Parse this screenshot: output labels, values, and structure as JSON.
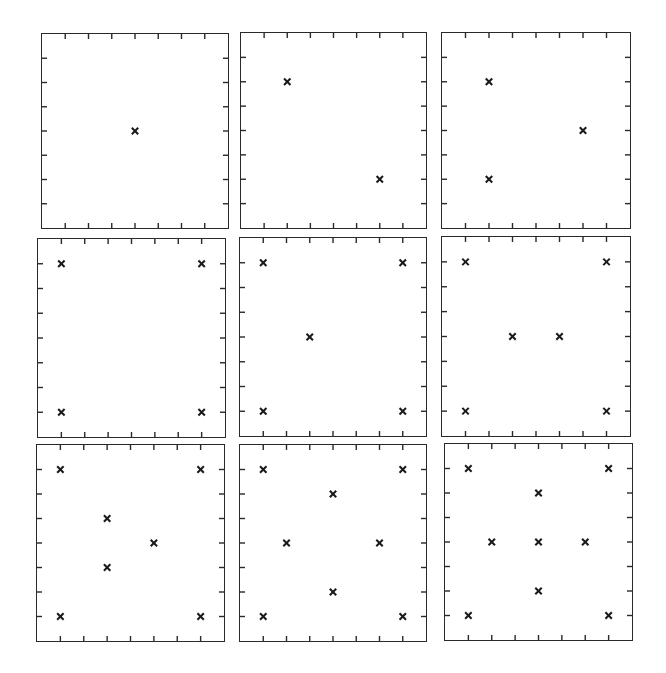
{
  "chart_data": {
    "type": "scatter",
    "title": "",
    "grid_divisions": 8,
    "marker": "x",
    "colors": {
      "frame": "#2a2a2a",
      "marker": "#1a1a1a",
      "background": "#ffffff"
    },
    "panels": [
      {
        "id": 1,
        "count": 1,
        "points": [
          [
            4,
            4
          ]
        ]
      },
      {
        "id": 2,
        "count": 2,
        "points": [
          [
            2,
            2
          ],
          [
            6,
            6
          ]
        ]
      },
      {
        "id": 3,
        "count": 3,
        "points": [
          [
            2,
            2
          ],
          [
            6,
            4
          ],
          [
            2,
            6
          ]
        ]
      },
      {
        "id": 4,
        "count": 4,
        "points": [
          [
            1,
            1
          ],
          [
            7,
            1
          ],
          [
            1,
            7
          ],
          [
            7,
            7
          ]
        ]
      },
      {
        "id": 5,
        "count": 5,
        "points": [
          [
            1,
            1
          ],
          [
            7,
            1
          ],
          [
            3,
            4
          ],
          [
            1,
            7
          ],
          [
            7,
            7
          ]
        ]
      },
      {
        "id": 6,
        "count": 6,
        "points": [
          [
            1,
            1
          ],
          [
            7,
            1
          ],
          [
            3,
            4
          ],
          [
            5,
            4
          ],
          [
            1,
            7
          ],
          [
            7,
            7
          ]
        ]
      },
      {
        "id": 7,
        "count": 7,
        "points": [
          [
            1,
            1
          ],
          [
            7,
            1
          ],
          [
            3,
            3
          ],
          [
            5,
            4
          ],
          [
            3,
            5
          ],
          [
            1,
            7
          ],
          [
            7,
            7
          ]
        ]
      },
      {
        "id": 8,
        "count": 8,
        "points": [
          [
            1,
            1
          ],
          [
            7,
            1
          ],
          [
            4,
            2
          ],
          [
            2,
            4
          ],
          [
            6,
            4
          ],
          [
            4,
            6
          ],
          [
            1,
            7
          ],
          [
            7,
            7
          ]
        ]
      },
      {
        "id": 9,
        "count": 9,
        "points": [
          [
            1,
            1
          ],
          [
            7,
            1
          ],
          [
            4,
            2
          ],
          [
            2,
            4
          ],
          [
            4,
            4
          ],
          [
            6,
            4
          ],
          [
            4,
            6
          ],
          [
            1,
            7
          ],
          [
            7,
            7
          ]
        ]
      }
    ],
    "layout": [
      {
        "id": 1,
        "x": 41,
        "y": 33,
        "w": 188,
        "h": 196
      },
      {
        "id": 2,
        "x": 240,
        "y": 32,
        "w": 187,
        "h": 197
      },
      {
        "id": 3,
        "x": 441,
        "y": 32,
        "w": 190,
        "h": 197
      },
      {
        "id": 4,
        "x": 37,
        "y": 238,
        "w": 189,
        "h": 200
      },
      {
        "id": 5,
        "x": 239,
        "y": 237,
        "w": 188,
        "h": 200
      },
      {
        "id": 6,
        "x": 441,
        "y": 236,
        "w": 190,
        "h": 201
      },
      {
        "id": 7,
        "x": 36,
        "y": 444,
        "w": 189,
        "h": 198
      },
      {
        "id": 8,
        "x": 239,
        "y": 444,
        "w": 188,
        "h": 198
      },
      {
        "id": 9,
        "x": 444,
        "y": 443,
        "w": 189,
        "h": 198
      }
    ]
  }
}
